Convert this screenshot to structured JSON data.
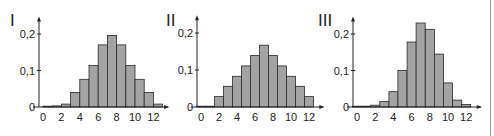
{
  "chart_data": [
    {
      "type": "bar",
      "title": "I",
      "xlabel": "",
      "ylabel": "",
      "categories": [
        0,
        1,
        2,
        3,
        4,
        5,
        6,
        7,
        8,
        9,
        10,
        11,
        12
      ],
      "x_ticks": [
        "0",
        "2",
        "4",
        "6",
        "8",
        "10",
        "12"
      ],
      "y_ticks": [
        "0",
        "0,1",
        "0,2"
      ],
      "ylim": [
        0,
        0.23
      ],
      "xlim": [
        -0.5,
        13.5
      ],
      "bar_alignment": "left-edge-on-value",
      "values": [
        0.001,
        0.003,
        0.008,
        0.04,
        0.076,
        0.114,
        0.17,
        0.196,
        0.17,
        0.114,
        0.076,
        0.04,
        0.008
      ],
      "grid": false,
      "legend": null
    },
    {
      "type": "bar",
      "title": "II",
      "xlabel": "",
      "ylabel": "",
      "categories": [
        0,
        1,
        2,
        3,
        4,
        5,
        6,
        7,
        8,
        9,
        10,
        11,
        12
      ],
      "x_ticks": [
        "0",
        "2",
        "4",
        "6",
        "8",
        "10",
        "12"
      ],
      "y_ticks": [
        "0",
        "0,1",
        "0,2"
      ],
      "ylim": [
        0,
        0.23
      ],
      "xlim": [
        -0.5,
        13.5
      ],
      "bar_alignment": "centered-on-value",
      "values": [
        0.0,
        0.0,
        0.028,
        0.056,
        0.083,
        0.111,
        0.139,
        0.167,
        0.139,
        0.111,
        0.083,
        0.056,
        0.028
      ],
      "grid": false,
      "legend": null
    },
    {
      "type": "bar",
      "title": "III",
      "xlabel": "",
      "ylabel": "",
      "categories": [
        0,
        1,
        2,
        3,
        4,
        5,
        6,
        7,
        8,
        9,
        10,
        11,
        12
      ],
      "x_ticks": [
        "0",
        "2",
        "4",
        "6",
        "8",
        "10",
        "12"
      ],
      "y_ticks": [
        "0",
        "0,1",
        "0,2"
      ],
      "ylim": [
        0,
        0.24
      ],
      "xlim": [
        -0.5,
        13.5
      ],
      "bar_alignment": "centered-on-value",
      "values": [
        0.001,
        0.002,
        0.005,
        0.015,
        0.042,
        0.1,
        0.178,
        0.23,
        0.213,
        0.145,
        0.066,
        0.019,
        0.007
      ],
      "grid": false,
      "legend": null
    }
  ],
  "panels": [
    {
      "label": "I",
      "origin_x": 39,
      "zero_y": 107,
      "unit_y_px": 365,
      "unit_x_px": 9.2,
      "x0_px": 43,
      "label_x": 10,
      "label_y": 26,
      "bar_offset": 0
    },
    {
      "label": "II",
      "origin_x": 197,
      "zero_y": 107,
      "unit_y_px": 370,
      "unit_x_px": 9.0,
      "x0_px": 201,
      "label_x": 166,
      "label_y": 26,
      "bar_offset": -0.5
    },
    {
      "label": "III",
      "origin_x": 353,
      "zero_y": 107,
      "unit_y_px": 365,
      "unit_x_px": 9.1,
      "x0_px": 357,
      "label_x": 318,
      "label_y": 26,
      "bar_offset": -0.5
    }
  ],
  "style": {
    "bar_fill": "#a3a3a3",
    "bar_stroke": "#2a2a2a",
    "axis_color": "#222222",
    "text_color": "#222222"
  }
}
